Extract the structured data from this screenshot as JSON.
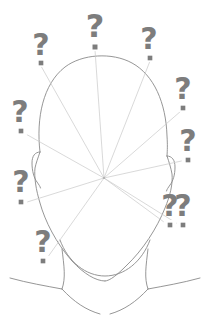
{
  "illustration": {
    "title": "Confused head with question marks",
    "subject": "head-silhouette-line-art",
    "background_color": "#ffffff",
    "stroke_color": "#8a8a8a",
    "ray_color": "#c9c9c9",
    "qmark_color": "#7d7d7d",
    "canvas": {
      "width": 215,
      "height": 323
    },
    "focus_point": {
      "x": 104,
      "y": 178,
      "label": "ray-convergence-point"
    },
    "question_marks": [
      {
        "id": "qm-top-left",
        "glyph": "?",
        "x": 41,
        "y": 46,
        "size": 30,
        "dot_x": 41,
        "dot_y": 63,
        "ray_to_x": 41,
        "ray_to_y": 66
      },
      {
        "id": "qm-top-center",
        "glyph": "?",
        "x": 95,
        "y": 28,
        "size": 32,
        "dot_x": 95,
        "dot_y": 47,
        "ray_to_x": 95,
        "ray_to_y": 50
      },
      {
        "id": "qm-top-right",
        "glyph": "?",
        "x": 149,
        "y": 40,
        "size": 30,
        "dot_x": 150,
        "dot_y": 58,
        "ray_to_x": 150,
        "ray_to_y": 61
      },
      {
        "id": "qm-right-upper",
        "glyph": "?",
        "x": 183,
        "y": 90,
        "size": 30,
        "dot_x": 183,
        "dot_y": 108,
        "ray_to_x": 181,
        "ray_to_y": 111
      },
      {
        "id": "qm-right-middle",
        "glyph": "?",
        "x": 188,
        "y": 142,
        "size": 30,
        "dot_x": 188,
        "dot_y": 160,
        "ray_to_x": 186,
        "ray_to_y": 160
      },
      {
        "id": "qm-right-lower",
        "glyph": "?",
        "x": 183,
        "y": 207,
        "size": 30,
        "dot_x": 183,
        "dot_y": 225,
        "ray_to_x": 181,
        "ray_to_y": 226
      },
      {
        "id": "qm-left-upper",
        "glyph": "?",
        "x": 20,
        "y": 113,
        "size": 30,
        "dot_x": 21,
        "dot_y": 131,
        "ray_to_x": 24,
        "ray_to_y": 133
      },
      {
        "id": "qm-left-lower",
        "glyph": "?",
        "x": 21,
        "y": 183,
        "size": 30,
        "dot_x": 21,
        "dot_y": 202,
        "ray_to_x": 24,
        "ray_to_y": 203
      },
      {
        "id": "qm-bottom-left",
        "glyph": "?",
        "x": 43,
        "y": 243,
        "size": 30,
        "dot_x": 43,
        "dot_y": 261,
        "ray_to_x": 45,
        "ray_to_y": 261
      },
      {
        "id": "qm-bottom-right",
        "glyph": "?",
        "x": 170,
        "y": 207,
        "size": 30,
        "dot_x": 170,
        "dot_y": 225,
        "ray_to_x": 168,
        "ray_to_y": 225
      }
    ]
  }
}
